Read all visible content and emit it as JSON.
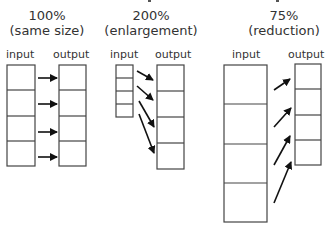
{
  "clipped_top_text": "",
  "panels": [
    {
      "title": "100%",
      "subtitle": "(same size)",
      "input_label": "input",
      "output_label": "output",
      "input_cells": 4,
      "output_cells": 4
    },
    {
      "title": "200%",
      "subtitle": "(enlargement)",
      "input_label": "input",
      "output_label": "output",
      "input_cells": 4,
      "output_cells": 4
    },
    {
      "title": "75%",
      "subtitle": "(reduction)",
      "input_label": "input",
      "output_label": "output",
      "input_cells": 4,
      "output_cells": 4
    }
  ],
  "colors": {
    "stroke": "#444444",
    "arrow": "#111111",
    "text": "#333333",
    "background": "#ffffff"
  }
}
